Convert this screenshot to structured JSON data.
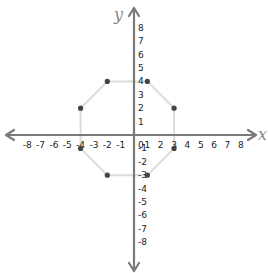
{
  "diagram": {
    "type": "coordinate-plane",
    "x_axis_label": "x",
    "y_axis_label": "y",
    "x_ticks": [
      "-8",
      "-7",
      "-6",
      "-5",
      "-4",
      "-3",
      "-2",
      "-1",
      "0",
      "1",
      "2",
      "3",
      "4",
      "5",
      "6",
      "7",
      "8"
    ],
    "y_ticks": [
      "8",
      "7",
      "6",
      "5",
      "4",
      "3",
      "2",
      "1",
      "-1",
      "-2",
      "-3",
      "-4",
      "-5",
      "-6",
      "-7",
      "-8"
    ],
    "range": {
      "x": [
        -8,
        8
      ],
      "y": [
        -8,
        8
      ]
    },
    "shape": "octagon",
    "vertices": [
      {
        "x": -2,
        "y": 4
      },
      {
        "x": 1,
        "y": 4
      },
      {
        "x": 3,
        "y": 2
      },
      {
        "x": 3,
        "y": -1
      },
      {
        "x": 1,
        "y": -3
      },
      {
        "x": -2,
        "y": -3
      },
      {
        "x": -4,
        "y": -1
      },
      {
        "x": -4,
        "y": 2
      }
    ],
    "colors": {
      "axis": "#7a7a7a",
      "polygon": "#dcdcdc",
      "point": "#444444",
      "text": "#222222"
    }
  }
}
